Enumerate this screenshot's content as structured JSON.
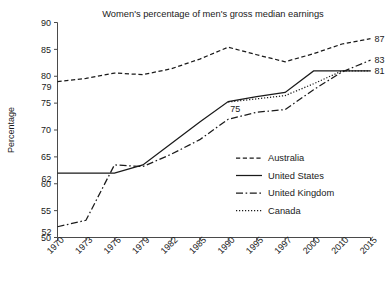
{
  "chart_data": {
    "type": "line",
    "title": "Women's percentage of men's gross median earnings",
    "xlabel": "",
    "ylabel": "Percentage",
    "ylim": [
      50,
      90
    ],
    "yticks": [
      50,
      55,
      60,
      65,
      70,
      75,
      80,
      85,
      90
    ],
    "grid": false,
    "legend_position": "center-right",
    "categories": [
      "1970",
      "1973",
      "1976",
      "1979",
      "1982",
      "1985",
      "1990",
      "1995",
      "1997",
      "2000",
      "2010",
      "2015"
    ],
    "series": [
      {
        "name": "Australia",
        "style": "dashed",
        "values": [
          79.0,
          79.6,
          80.6,
          80.3,
          81.4,
          83.2,
          85.4,
          84.0,
          82.7,
          84.2,
          86.0,
          87.0
        ]
      },
      {
        "name": "United States",
        "style": "solid",
        "values": [
          62.0,
          62.0,
          62.0,
          63.5,
          67.5,
          71.5,
          75.3,
          76.2,
          77.0,
          81.0,
          81.0,
          81.0
        ]
      },
      {
        "name": "United Kingdom",
        "style": "dash-dot",
        "values": [
          52.0,
          53.2,
          63.5,
          63.2,
          65.5,
          68.2,
          72.0,
          73.3,
          73.8,
          77.5,
          80.8,
          83.0
        ]
      },
      {
        "name": "Canada",
        "style": "dotted",
        "values": [
          null,
          null,
          null,
          null,
          null,
          null,
          75.2,
          75.8,
          76.4,
          78.6,
          81.0,
          81.0
        ]
      }
    ],
    "annotations": [
      {
        "label": "79",
        "series": "Australia",
        "category": "1970",
        "value": 79.0,
        "side": "left"
      },
      {
        "label": "62",
        "series": "United States",
        "category": "1970",
        "value": 62.0,
        "side": "left"
      },
      {
        "label": "52",
        "series": "United Kingdom",
        "category": "1970",
        "value": 52.0,
        "side": "left"
      },
      {
        "label": "75",
        "series": "United States",
        "category": "1990",
        "value": 75.3,
        "side": "below"
      },
      {
        "label": "87",
        "series": "Australia",
        "category": "2015",
        "value": 87.0,
        "side": "right"
      },
      {
        "label": "83",
        "series": "United Kingdom",
        "category": "2015",
        "value": 83.0,
        "side": "right"
      },
      {
        "label": "81",
        "series": "United States",
        "category": "2015",
        "value": 81.0,
        "side": "right"
      }
    ]
  },
  "legend": {
    "items": [
      {
        "label": "Australia"
      },
      {
        "label": "United States"
      },
      {
        "label": "United Kingdom"
      },
      {
        "label": "Canada"
      }
    ]
  }
}
